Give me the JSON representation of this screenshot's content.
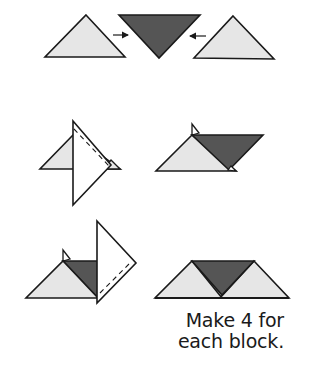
{
  "diagram": {
    "colors": {
      "light_fabric": "#e6e6e6",
      "dark_fabric": "#555555",
      "white_fabric": "#ffffff",
      "outline": "#1a1a1a"
    },
    "steps": [
      {
        "id": "step-1",
        "description": "Place light triangles on each side of dark triangle",
        "arrows": [
          "right",
          "left"
        ]
      },
      {
        "id": "step-2",
        "description": "Sew first light triangle to dark triangle along dashed line, press"
      },
      {
        "id": "step-3",
        "description": "Sew second light triangle, press; finished unit"
      }
    ],
    "caption": {
      "line1": "Make 4 for",
      "line2": "each block."
    }
  }
}
